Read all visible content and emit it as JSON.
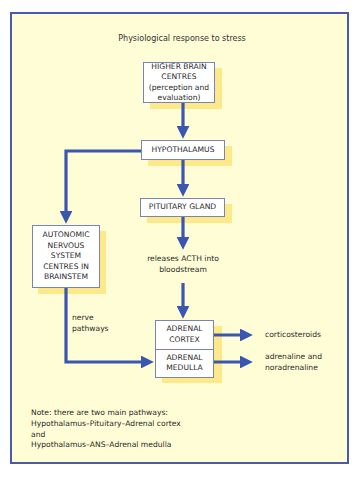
{
  "title": "Physiological response to stress",
  "boxes": {
    "higher_brain": [
      "HIGHER BRAIN",
      "CENTRES",
      "(perception and",
      "evaluation)"
    ],
    "hypothalamus": "HYPOTHALAMUS",
    "pituitary": "PITUITARY GLAND",
    "ans": [
      "AUTONOMIC",
      "NERVOUS",
      "SYSTEM",
      "CENTRES IN",
      "BRAINSTEM"
    ],
    "adrenal_cortex": [
      "ADRENAL",
      "CORTEX"
    ],
    "adrenal_medulla": [
      "ADRENAL",
      "MEDULLA"
    ]
  },
  "labels": {
    "acth": [
      "releases ACTH into",
      "bloodstream"
    ],
    "nerve": [
      "nerve",
      "pathways"
    ],
    "corticosteroids": "corticosteroids",
    "adrenaline": [
      "adrenaline and",
      "noradrenaline"
    ]
  },
  "note": [
    "Note: there are two main pathways:",
    "Hypothalamus–Pituitary–Adrenal cortex",
    "and",
    "Hypothalamus–ANS–Adrenal medulla"
  ],
  "colors": {
    "arrow": "#3a56b0",
    "background": "#fffdd6",
    "border": "#4a5aa8",
    "shadow": "#fde98a"
  }
}
